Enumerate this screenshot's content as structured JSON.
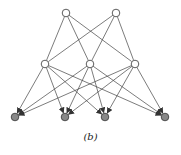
{
  "caption": "(b)",
  "colors": {
    "edge": "#444444",
    "hidden_fill": "#ffffff",
    "output_fill": "#888888",
    "stroke": "#333333"
  },
  "nodes": {
    "top": [
      {
        "x": 66,
        "y": 13
      },
      {
        "x": 116,
        "y": 13
      }
    ],
    "middle": [
      {
        "x": 45,
        "y": 64
      },
      {
        "x": 90,
        "y": 64
      },
      {
        "x": 135,
        "y": 64
      }
    ],
    "bottom": [
      {
        "x": 15,
        "y": 117
      },
      {
        "x": 65,
        "y": 117
      },
      {
        "x": 105,
        "y": 117
      },
      {
        "x": 165,
        "y": 117
      }
    ]
  },
  "edges": {
    "top_to_middle": "all",
    "middle_to_bottom": "all, directed"
  }
}
